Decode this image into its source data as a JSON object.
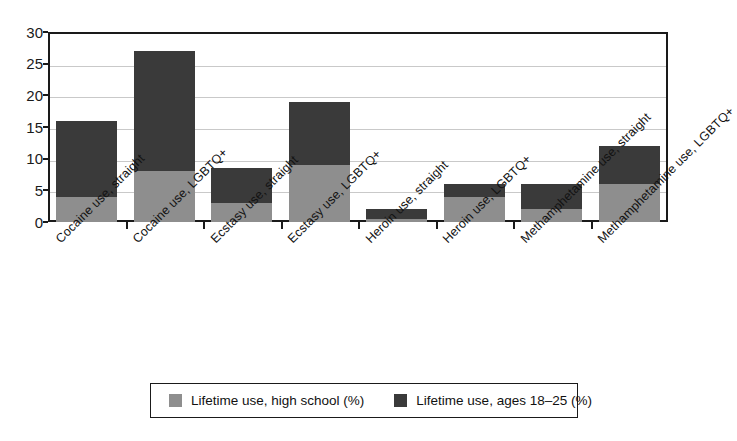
{
  "chart_data": {
    "type": "bar",
    "subtype": "stacked-vertical",
    "title": "",
    "xlabel": "",
    "ylabel": "",
    "ylim": [
      0,
      30
    ],
    "yticks": [
      0,
      5,
      10,
      15,
      20,
      25,
      30
    ],
    "grid": true,
    "legend_position": "bottom",
    "categories": [
      "Cocaine use, straight",
      "Cocaine use, LGBTQ+",
      "Ecstasy use, straight",
      "Ecstasy use, LGBTQ+",
      "Heroin use, straight",
      "Heroin use, LGBTQ+",
      "Methamphetamine use, straight",
      "Methamphetamine use, LGBTQ+"
    ],
    "series": [
      {
        "name": "Lifetime use, high school (%)",
        "color": "#8e8e8e",
        "values": [
          4,
          8,
          3,
          9,
          0.5,
          4,
          2,
          6
        ]
      },
      {
        "name": "Lifetime use, ages 18–25 (%)",
        "color": "#3a3a3a",
        "values": [
          12,
          19,
          5.5,
          10,
          1.5,
          2,
          4,
          6
        ]
      }
    ],
    "totals": [
      16,
      27,
      8.5,
      19,
      2,
      6,
      6,
      12
    ]
  },
  "axis": {
    "y_tick_labels": [
      "30",
      "25",
      "20",
      "15",
      "10",
      "5",
      "0"
    ]
  },
  "legend": {
    "items": [
      {
        "label": "Lifetime use, high school (%)",
        "swatch": "light"
      },
      {
        "label": "Lifetime use, ages 18–25 (%)",
        "swatch": "dark"
      }
    ]
  },
  "colors": {
    "light_gray": "#8e8e8e",
    "dark_gray": "#3a3a3a",
    "axis": "#1a1a1a",
    "grid": "#c9c9c9",
    "background": "#ffffff"
  }
}
